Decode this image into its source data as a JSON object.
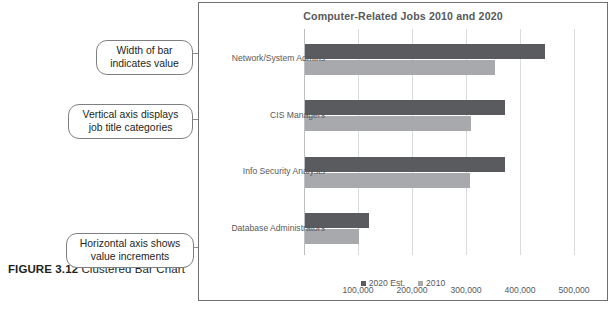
{
  "figure": {
    "number_label": "FIGURE 3.12",
    "caption": " Clustered Bar Chart"
  },
  "callouts": [
    {
      "name": "width-of-bar",
      "text": "Width of bar indicates value"
    },
    {
      "name": "vertical-axis",
      "text": "Vertical axis displays job title categories"
    },
    {
      "name": "horizontal-axis",
      "text": "Horizontal axis shows value increments"
    }
  ],
  "colors": {
    "series_2020": "#595b5e",
    "series_2010": "#a7a9ac",
    "frame_border": "#6e7073",
    "gridline": "#d9dadb",
    "axis": "#bcbec0",
    "text": "#58595b",
    "callout_border": "#7d7f82"
  },
  "chart_data": {
    "type": "bar",
    "orientation": "horizontal",
    "title": "Computer-Related Jobs 2010 and 2020",
    "xlabel": "",
    "ylabel": "",
    "categories": [
      "Network/System Admins",
      "CIS Managers",
      "Info Security Analysts",
      "Database Administrators"
    ],
    "series": [
      {
        "name": "2020 Est.",
        "color": "#595b5e",
        "values": [
          444000,
          371000,
          371000,
          119000
        ]
      },
      {
        "name": "2010",
        "color": "#a7a9ac",
        "values": [
          352000,
          308000,
          306000,
          100000
        ]
      }
    ],
    "xlim": [
      0,
      509000
    ],
    "xticks": [
      100000,
      200000,
      300000,
      400000,
      500000
    ],
    "xtick_labels": [
      "100,000",
      "200,000",
      "300,000",
      "400,000",
      "500,000"
    ],
    "grid": true,
    "grid_axis": "x",
    "legend": {
      "position": "bottom",
      "entries": [
        "2020 Est.",
        "2010"
      ]
    }
  }
}
